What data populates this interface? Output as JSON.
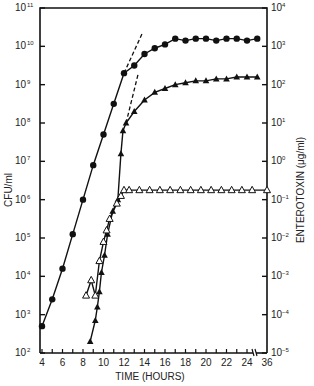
{
  "chart_data": {
    "type": "line",
    "title": "",
    "xlabel": "TIME (HOURS)",
    "ylabel_left": "CFU/ml",
    "ylabel_right": "ENTEROTOXIN (μg/ml)",
    "x_ticks": [
      "4",
      "6",
      "8",
      "10",
      "12",
      "14",
      "16",
      "18",
      "20",
      "22",
      "24",
      "36"
    ],
    "x_axis_break": "between 24 and 36",
    "y_left_scale": "log",
    "y_left_range": [
      100,
      100000000000
    ],
    "y_left_ticks": [
      "10^2",
      "10^3",
      "10^4",
      "10^5",
      "10^6",
      "10^7",
      "10^8",
      "10^9",
      "10^10",
      "10^11"
    ],
    "y_right_scale": "log",
    "y_right_range": [
      1e-05,
      10000
    ],
    "y_right_ticks": [
      "10^-5",
      "10^-4",
      "10^-3",
      "10^-2",
      "10^-1",
      "10^0",
      "10^1",
      "10^2",
      "10^3",
      "10^4"
    ],
    "grid": false,
    "legend": "none",
    "series": [
      {
        "name": "CFU/ml (filled circles)",
        "axis": "left",
        "marker": "filled-circle",
        "x": [
          4,
          5,
          6,
          7,
          8,
          9,
          10,
          11,
          12,
          13,
          14,
          15,
          16,
          17,
          18,
          19,
          20,
          21,
          22,
          23,
          24,
          25
        ],
        "y_log10": [
          2.7,
          3.4,
          4.2,
          5.1,
          6.0,
          6.9,
          7.7,
          8.5,
          9.3,
          9.5,
          9.8,
          9.95,
          10.05,
          10.2,
          10.15,
          10.2,
          10.2,
          10.15,
          10.2,
          10.2,
          10.15,
          10.2
        ]
      },
      {
        "name": "CFU/ml (filled triangles)",
        "axis": "left",
        "marker": "filled-triangle",
        "x": [
          8.7,
          9.2,
          9.4,
          9.6,
          9.8,
          10.1,
          10.4,
          10.9,
          11.4,
          11.7,
          11.9,
          12.2,
          13,
          14,
          15,
          16,
          17,
          18,
          19,
          20,
          21,
          22,
          23,
          24,
          25
        ],
        "y_log10": [
          2.3,
          2.85,
          3.2,
          3.6,
          4.1,
          4.55,
          5.1,
          5.7,
          6.0,
          7.2,
          7.8,
          8.0,
          8.3,
          8.6,
          8.8,
          8.9,
          9.0,
          9.05,
          9.1,
          9.1,
          9.15,
          9.15,
          9.2,
          9.2,
          9.2
        ]
      },
      {
        "name": "Enterotoxin (open triangles)",
        "axis": "right",
        "marker": "open-triangle",
        "x": [
          8.3,
          8.8,
          9.2,
          9.6,
          10.0,
          10.3,
          10.6,
          11.3,
          11.7,
          12.0,
          12.5,
          13.5,
          14.5,
          15.5,
          16.5,
          17.5,
          18.5,
          19.5,
          20.5,
          21.5,
          22.5,
          23.5,
          24.5,
          36
        ],
        "y_log10": [
          -3.5,
          -3.1,
          -3.5,
          -2.6,
          -2.1,
          -1.8,
          -1.5,
          -1.1,
          -0.9,
          -0.75,
          -0.75,
          -0.75,
          -0.75,
          -0.75,
          -0.75,
          -0.75,
          -0.75,
          -0.75,
          -0.75,
          -0.75,
          -0.75,
          -0.75,
          -0.75,
          -0.75
        ]
      }
    ],
    "annotations": [
      {
        "type": "dashed-extrapolation",
        "series": "filled circles",
        "from": [
          12,
          9.3
        ],
        "to": [
          13.8,
          10.35
        ]
      },
      {
        "type": "dashed-extrapolation",
        "series": "filled triangles",
        "from": [
          12.2,
          8.0
        ],
        "to": [
          13.4,
          9.3
        ]
      }
    ]
  },
  "labels": {
    "x_title": "TIME (HOURS)",
    "y_left_title": "CFU/ml",
    "y_right_title": "ENTEROTOXIN (μg/ml)",
    "x_ticks": [
      "4",
      "6",
      "8",
      "10",
      "12",
      "14",
      "16",
      "18",
      "20",
      "22",
      "24",
      "36"
    ],
    "y_left_ticks": [
      {
        "base": "10",
        "exp": "2"
      },
      {
        "base": "10",
        "exp": "3"
      },
      {
        "base": "10",
        "exp": "4"
      },
      {
        "base": "10",
        "exp": "5"
      },
      {
        "base": "10",
        "exp": "6"
      },
      {
        "base": "10",
        "exp": "7"
      },
      {
        "base": "10",
        "exp": "8"
      },
      {
        "base": "10",
        "exp": "9"
      },
      {
        "base": "10",
        "exp": "10"
      },
      {
        "base": "10",
        "exp": "11"
      }
    ],
    "y_right_ticks": [
      {
        "base": "10",
        "exp": "−5"
      },
      {
        "base": "10",
        "exp": "−4"
      },
      {
        "base": "10",
        "exp": "−3"
      },
      {
        "base": "10",
        "exp": "−2"
      },
      {
        "base": "10",
        "exp": "−1"
      },
      {
        "base": "10",
        "exp": "0"
      },
      {
        "base": "10",
        "exp": "1"
      },
      {
        "base": "10",
        "exp": "2"
      },
      {
        "base": "10",
        "exp": "3"
      },
      {
        "base": "10",
        "exp": "4"
      }
    ]
  }
}
